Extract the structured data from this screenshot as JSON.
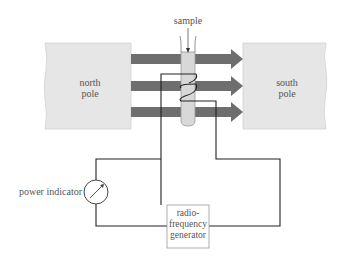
{
  "labels": {
    "sample": "sample",
    "north_pole": "north\npole",
    "north_line1": "north",
    "north_line2": "pole",
    "south_line1": "south",
    "south_line2": "pole",
    "power_indicator": "power indicator",
    "generator_line1": "radio-",
    "generator_line2": "frequency",
    "generator_line3": "generator"
  },
  "colors": {
    "pole_fill": "#e6e6e6",
    "arrow_fill": "#6e6e6e",
    "tube_fill": "#d8d8d8",
    "wire": "#222222",
    "text": "#555555"
  },
  "field_arrows": {
    "count": 3,
    "direction": "north-to-south"
  }
}
